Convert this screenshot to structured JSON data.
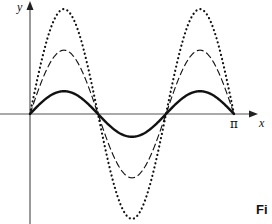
{
  "figure": {
    "y_axis_label": "y",
    "x_axis_label": "x",
    "x_tick_label": "π",
    "caption_fragment": "Fi",
    "colors": {
      "ink": "#111111",
      "axis": "#555555",
      "background": "#ffffff"
    }
  },
  "chart_data": {
    "type": "line",
    "title": "",
    "xlabel": "x",
    "ylabel": "y",
    "x_ticks": [
      {
        "value": 3.14159,
        "label": "π"
      }
    ],
    "xlim": [
      0,
      3.14159
    ],
    "grid": false,
    "legend": null,
    "series": [
      {
        "name": "solid (smallest amplitude)",
        "style": "solid",
        "function": "A1*sin(3x)",
        "amplitude_relative": 1.0,
        "x": [
          0,
          0.5236,
          1.0472,
          1.5708,
          2.0944,
          2.618,
          3.1416
        ],
        "values": [
          0,
          1,
          0,
          -1,
          0,
          1,
          0
        ]
      },
      {
        "name": "dashed (medium amplitude)",
        "style": "dashed",
        "function": "A2*sin(3x)",
        "amplitude_relative": 2.8,
        "x": [
          0,
          0.5236,
          1.0472,
          1.5708,
          2.0944,
          2.618,
          3.1416
        ],
        "values": [
          0,
          2.8,
          0,
          -2.8,
          0,
          2.8,
          0
        ]
      },
      {
        "name": "dotted (largest amplitude)",
        "style": "dotted",
        "function": "A3*sin(3x)",
        "amplitude_relative": 4.6,
        "x": [
          0,
          0.5236,
          1.0472,
          1.5708,
          2.0944,
          2.618,
          3.1416
        ],
        "values": [
          0,
          4.6,
          0,
          -4.6,
          0,
          4.6,
          0
        ]
      }
    ],
    "annotations": [
      "zero crossings at x = 0, π/3, 2π/3, π"
    ]
  }
}
